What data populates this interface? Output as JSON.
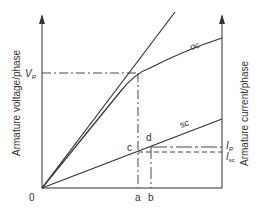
{
  "diagram": {
    "y_left_label": "Armature voltage/phase",
    "y_right_label": "Armature current/phase",
    "origin_label": "0",
    "curves": {
      "oc_label": "oc",
      "sc_label": "sc"
    },
    "points": {
      "c": "c",
      "d": "d",
      "a": "a",
      "b": "b"
    },
    "markers": {
      "vr_main": "V",
      "vr_sub": "R",
      "ir_main": "I",
      "ir_sub": "R",
      "isc_main": "I",
      "isc_sub": "sc"
    },
    "colors": {
      "line": "#333333",
      "background": "#ffffff"
    }
  }
}
